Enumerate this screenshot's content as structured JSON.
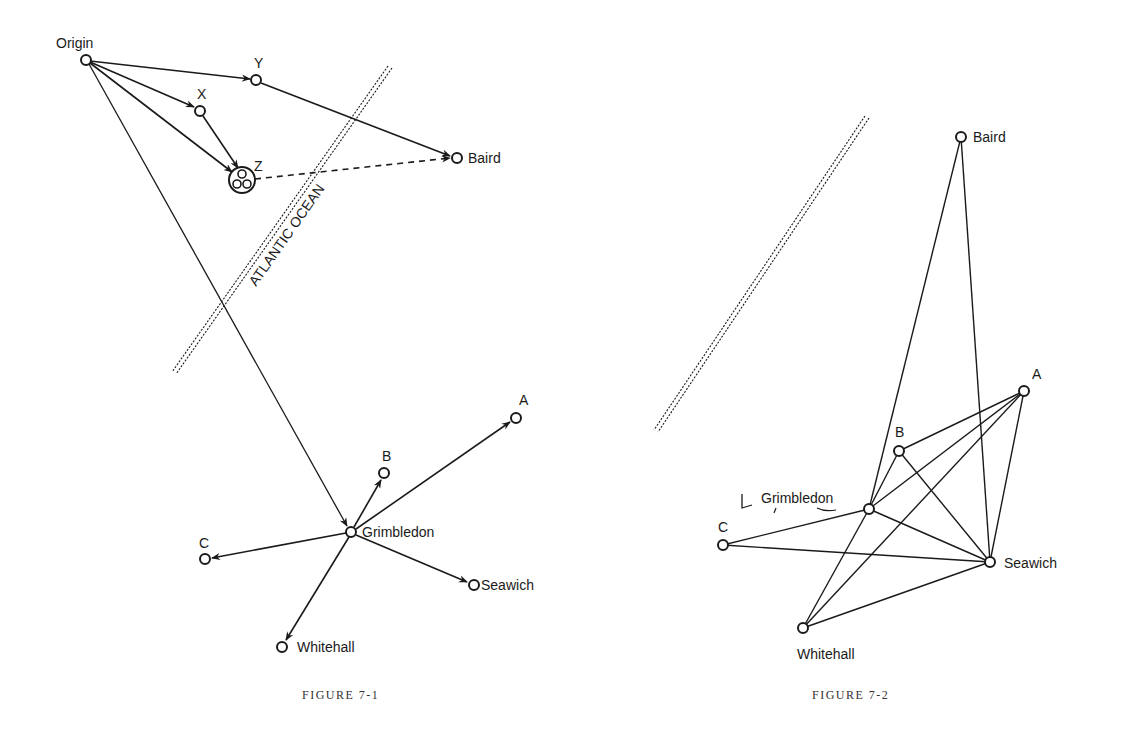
{
  "figure1": {
    "caption": "FIGURE 7-1",
    "ocean_label": "ATLANTIC OCEAN",
    "nodes": {
      "origin": {
        "label": "Origin",
        "x": 86,
        "y": 60
      },
      "y": {
        "label": "Y",
        "x": 256,
        "y": 80
      },
      "x": {
        "label": "X",
        "x": 200,
        "y": 111
      },
      "z": {
        "label": "Z",
        "x": 242,
        "y": 180
      },
      "baird": {
        "label": "Baird",
        "x": 457,
        "y": 158
      },
      "grimbledon": {
        "label": "Grimbledon",
        "x": 351,
        "y": 532
      },
      "a": {
        "label": "A",
        "x": 516,
        "y": 418
      },
      "b": {
        "label": "B",
        "x": 384,
        "y": 473
      },
      "c": {
        "label": "C",
        "x": 205,
        "y": 559
      },
      "seawich": {
        "label": "Seawich",
        "x": 474,
        "y": 585
      },
      "whitehall": {
        "label": "Whitehall",
        "x": 282,
        "y": 647
      }
    }
  },
  "figure2": {
    "caption": "FIGURE 7-2",
    "nodes": {
      "baird": {
        "label": "Baird",
        "x": 961,
        "y": 137
      },
      "a": {
        "label": "A",
        "x": 1024,
        "y": 391
      },
      "b": {
        "label": "B",
        "x": 899,
        "y": 451
      },
      "grimbledon": {
        "label": "Grimbledon",
        "x": 869,
        "y": 509
      },
      "c": {
        "label": "C",
        "x": 723,
        "y": 545
      },
      "seawich": {
        "label": "Seawich",
        "x": 990,
        "y": 562
      },
      "whitehall": {
        "label": "Whitehall",
        "x": 803,
        "y": 628
      }
    }
  }
}
